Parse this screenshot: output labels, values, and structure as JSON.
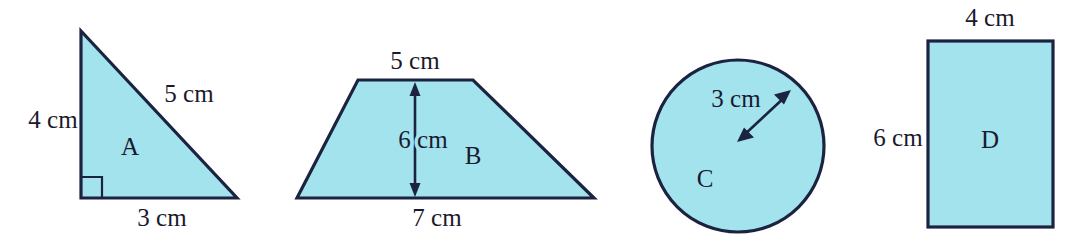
{
  "figure": {
    "background_color": "#ffffff",
    "shape_fill_color": "#a2e3ee",
    "shape_stroke_color": "#1c2340",
    "label_text_color": "#1a1a2e",
    "shapes": [
      {
        "id": "A",
        "kind": "right-triangle",
        "letter": "A",
        "dimensions": [
          {
            "name": "vertical-leg",
            "text": "4 cm"
          },
          {
            "name": "hypotenuse",
            "text": "5 cm"
          },
          {
            "name": "base",
            "text": "3 cm"
          }
        ],
        "has_right_angle_mark": true
      },
      {
        "id": "B",
        "kind": "trapezoid",
        "letter": "B",
        "dimensions": [
          {
            "name": "top-side",
            "text": "5 cm"
          },
          {
            "name": "height",
            "text": "6 cm"
          },
          {
            "name": "bottom-side",
            "text": "7 cm"
          }
        ],
        "has_height_arrow": true
      },
      {
        "id": "C",
        "kind": "circle",
        "letter": "C",
        "dimensions": [
          {
            "name": "radius",
            "text": "3 cm"
          }
        ],
        "has_radius_arrow": true
      },
      {
        "id": "D",
        "kind": "rectangle",
        "letter": "D",
        "dimensions": [
          {
            "name": "width",
            "text": "4 cm"
          },
          {
            "name": "height",
            "text": "6 cm"
          }
        ]
      }
    ],
    "labels": {
      "triangle_letter": "A",
      "triangle_leg": "4 cm",
      "triangle_hypotenuse": "5 cm",
      "triangle_base": "3 cm",
      "trapezoid_letter": "B",
      "trapezoid_top": "5 cm",
      "trapezoid_height": "6 cm",
      "trapezoid_bottom": "7 cm",
      "circle_letter": "C",
      "circle_radius": "3 cm",
      "rectangle_letter": "D",
      "rectangle_width": "4 cm",
      "rectangle_height": "6 cm"
    }
  }
}
